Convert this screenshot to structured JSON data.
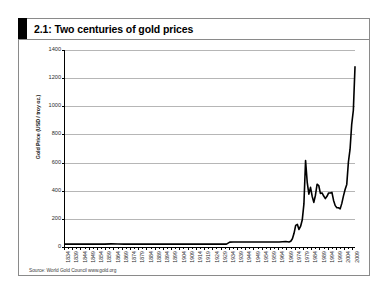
{
  "figure": {
    "number": "2.1",
    "title": "2.1: Two centuries of gold prices",
    "source": "Source: World Gold Council www.gold.org",
    "frame_color": "#8a8a8a",
    "accent_color": "#000000",
    "line_color": "#000000",
    "gridline_color": "#b6b6b6"
  },
  "chart_data": {
    "type": "line",
    "title": "2.1: Two centuries of gold prices",
    "xlabel": "",
    "ylabel": "Gold Price (USD / troy oz.)",
    "ylim": [
      0,
      1400
    ],
    "yticks": [
      0,
      200,
      400,
      600,
      800,
      1000,
      1200,
      1400
    ],
    "ytick_labels": [
      "0",
      "200",
      "400",
      "600",
      "800",
      "1000",
      "1200",
      "1400"
    ],
    "grid": true,
    "legend": "none",
    "xlim": [
      1834,
      2010
    ],
    "xtick_labels": [
      "1834",
      "1839",
      "1844",
      "1849",
      "1854",
      "1859",
      "1864",
      "1869",
      "1874",
      "1879",
      "1884",
      "1889",
      "1894",
      "1899",
      "1904",
      "1909",
      "1914",
      "1919",
      "1924",
      "1929",
      "1934",
      "1939",
      "1944",
      "1949",
      "1954",
      "1959",
      "1964",
      "1969",
      "1974",
      "1979",
      "1984",
      "1989",
      "1994",
      "1999",
      "2004",
      "2009"
    ],
    "series": [
      {
        "name": "Gold price (USD / troy oz.)",
        "x": [
          1834,
          1838,
          1842,
          1846,
          1850,
          1854,
          1858,
          1862,
          1866,
          1870,
          1874,
          1878,
          1882,
          1886,
          1890,
          1894,
          1898,
          1902,
          1906,
          1910,
          1914,
          1918,
          1922,
          1926,
          1930,
          1932,
          1934,
          1936,
          1940,
          1944,
          1948,
          1952,
          1956,
          1960,
          1964,
          1968,
          1970,
          1971,
          1972,
          1973,
          1974,
          1975,
          1976,
          1977,
          1978,
          1979,
          1980,
          1981,
          1982,
          1983,
          1984,
          1985,
          1986,
          1987,
          1988,
          1989,
          1990,
          1991,
          1992,
          1993,
          1994,
          1995,
          1996,
          1997,
          1998,
          1999,
          2000,
          2001,
          2002,
          2003,
          2004,
          2005,
          2006,
          2007,
          2008,
          2009,
          2010
        ],
        "values": [
          20.7,
          20.7,
          20.7,
          20.7,
          20.7,
          20.7,
          20.7,
          22.5,
          21.2,
          20.7,
          20.7,
          20.7,
          20.7,
          20.7,
          20.7,
          20.7,
          20.7,
          20.7,
          20.7,
          20.7,
          20.7,
          20.7,
          20.7,
          20.7,
          20.7,
          20.7,
          34.7,
          35.0,
          35.0,
          35.0,
          35.0,
          35.0,
          35.0,
          35.3,
          35.1,
          39.3,
          36.0,
          40.8,
          58.4,
          97.3,
          154.0,
          160.9,
          124.8,
          147.7,
          193.2,
          306.0,
          615.0,
          460.0,
          376.0,
          424.0,
          361.0,
          317.0,
          368.0,
          446.0,
          437.0,
          381.0,
          384.0,
          362.0,
          344.0,
          360.0,
          384.0,
          384.0,
          388.0,
          331.0,
          294.0,
          279.0,
          279.0,
          271.0,
          310.0,
          363.0,
          409.0,
          445.0,
          604.0,
          695.0,
          872.0,
          972.0,
          1280.0
        ],
        "color": "#000000",
        "width": 1.6
      }
    ]
  }
}
